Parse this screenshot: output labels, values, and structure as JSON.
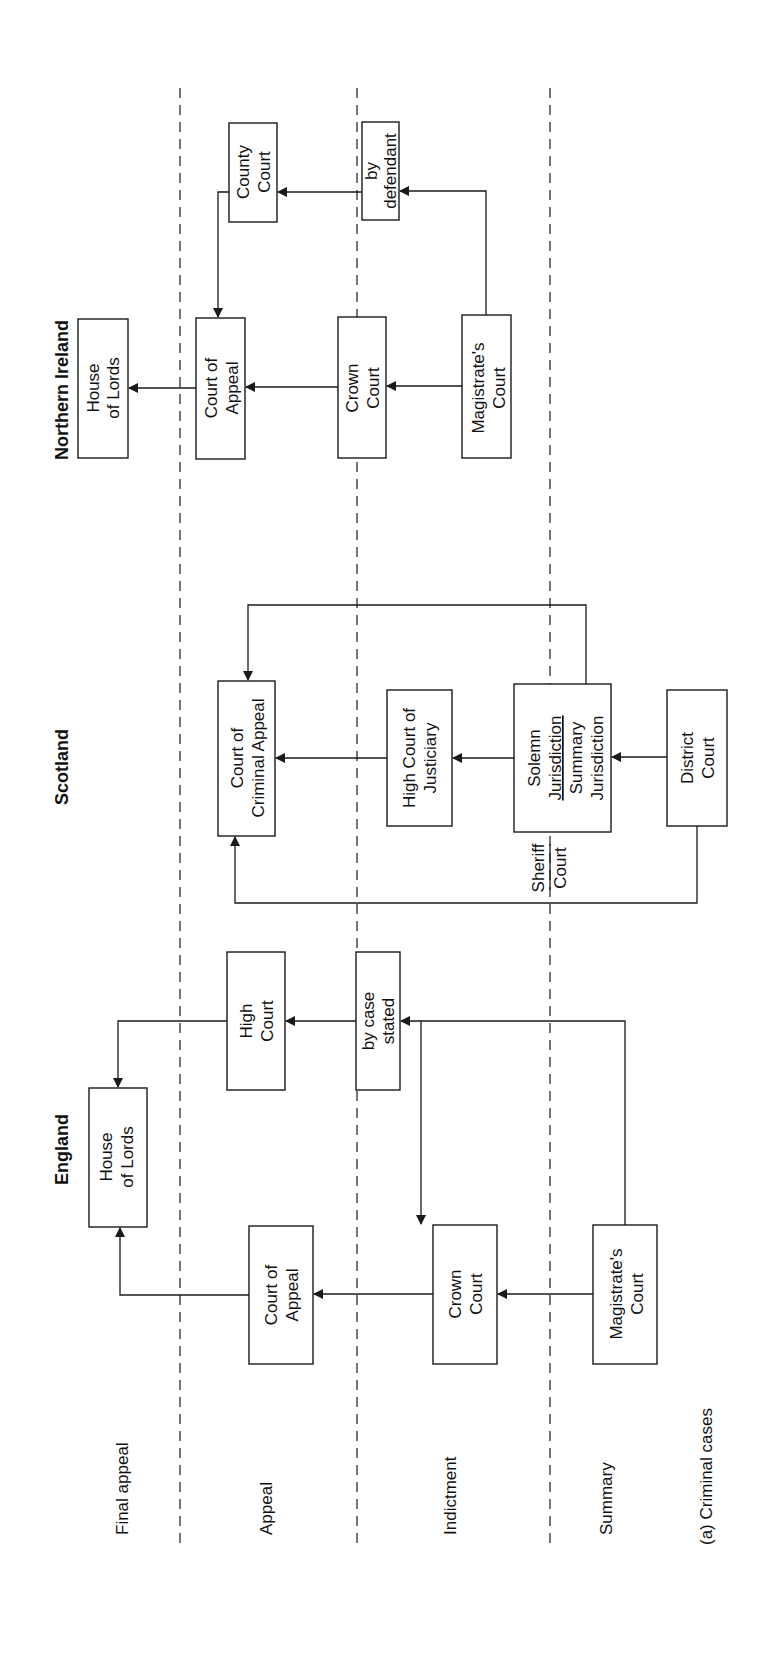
{
  "caption": "(a) Criminal cases",
  "lanes": {
    "final_appeal": "Final appeal",
    "appeal": "Appeal",
    "indictment": "Indictment",
    "summary": "Summary"
  },
  "jurisdictions": {
    "england": {
      "title": "England",
      "house_of_lords": [
        "House",
        "of Lords"
      ],
      "court_of_appeal": [
        "Court of",
        "Appeal"
      ],
      "high_court": [
        "High",
        "Court"
      ],
      "crown_court": [
        "Crown",
        "Court"
      ],
      "by_case_stated": [
        "by case",
        "stated"
      ],
      "magistrates_court": [
        "Magistrate's",
        "Court"
      ]
    },
    "scotland": {
      "title": "Scotland",
      "court_of_criminal_appeal": [
        "Court of",
        "Criminal Appeal"
      ],
      "high_court_of_justiciary": [
        "High Court of",
        "Justiciary"
      ],
      "sheriff_court_solemn": [
        "Solemn",
        "Jurisdiction"
      ],
      "sheriff_court_summary": [
        "Summary",
        "Jurisdiction"
      ],
      "sheriff_court_label": [
        "Sheriff",
        "Court"
      ],
      "district_court": [
        "District",
        "Court"
      ]
    },
    "northern_ireland": {
      "title": "Northern Ireland",
      "house_of_lords": [
        "House",
        "of Lords"
      ],
      "court_of_appeal": [
        "Court of",
        "Appeal"
      ],
      "county_court": [
        "County",
        "Court"
      ],
      "crown_court": [
        "Crown",
        "Court"
      ],
      "by_defendant": [
        "by",
        "defendant"
      ],
      "magistrates_court": [
        "Magistrate's",
        "Court"
      ]
    }
  },
  "colors": {
    "ink": "#1a1a1a",
    "background": "#ffffff"
  }
}
